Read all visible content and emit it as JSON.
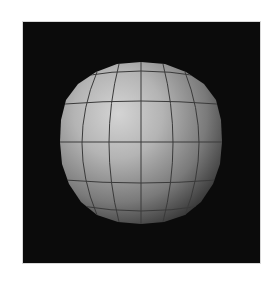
{
  "image": {
    "subject": "shaded 3D sphere with latitude/longitude grid",
    "background_color": "#0b0b0b",
    "page_background": "#ffffff",
    "sphere": {
      "center_x": 118,
      "center_y": 120,
      "radius": 80,
      "highlight_color": "#d4d4d4",
      "mid_color": "#8e8e8e",
      "shadow_color": "#2e2e2e",
      "grid_color": "#3a3a3a",
      "light_direction": "upper-left"
    }
  }
}
